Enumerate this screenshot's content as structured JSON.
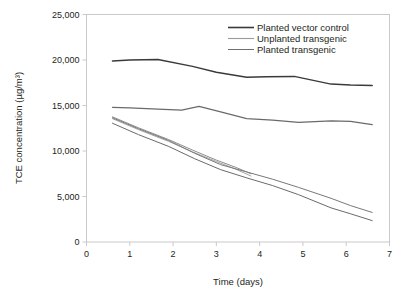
{
  "chart_data": {
    "type": "line",
    "title": "",
    "xlabel": "Time (days)",
    "ylabel": "TCE concentration (µg/m³)",
    "xlim": [
      0,
      7
    ],
    "ylim": [
      0,
      25000
    ],
    "xticks": [
      "0",
      "1",
      "2",
      "3",
      "4",
      "5",
      "6",
      "7"
    ],
    "xtick_values": [
      0,
      1,
      2,
      3,
      4,
      5,
      6,
      7
    ],
    "yticks": [
      "0",
      "5,000",
      "10,000",
      "15,000",
      "20,000",
      "25,000"
    ],
    "ytick_values": [
      0,
      5000,
      10000,
      15000,
      20000,
      25000
    ],
    "grid": false,
    "legend_position": "top-right",
    "legend": [
      {
        "name": "Planted vector control",
        "color": "#3a3a3a",
        "width": 1.6
      },
      {
        "name": "Unplanted transgenic",
        "color": "#9a9a9a",
        "width": 1.1
      },
      {
        "name": "Planted transgenic",
        "color": "#6f6f6f",
        "width": 1.0
      }
    ],
    "series": [
      {
        "name": "Planted vector control",
        "group": "Planted vector control",
        "color": "#3a3a3a",
        "width": 1.5,
        "x": [
          0.6,
          1.0,
          1.65,
          2.45,
          3.0,
          3.7,
          4.15,
          4.8,
          5.65,
          6.1,
          6.6
        ],
        "y": [
          19900,
          20000,
          20050,
          19300,
          18650,
          18100,
          18150,
          18200,
          17350,
          17250,
          17200
        ]
      },
      {
        "name": "Planted vector control 2",
        "group": "Planted vector control",
        "color": "#6a6a6a",
        "width": 1.2,
        "x": [
          0.6,
          1.0,
          1.65,
          2.2,
          2.6,
          3.1,
          3.7,
          4.3,
          4.9,
          5.65,
          6.1,
          6.6
        ],
        "y": [
          14800,
          14750,
          14600,
          14500,
          14900,
          14300,
          13550,
          13400,
          13150,
          13300,
          13250,
          12900
        ]
      },
      {
        "name": "Unplanted transgenic A",
        "group": "Unplanted transgenic",
        "color": "#8e8e8e",
        "width": 1.0,
        "x": [
          0.6,
          1.2,
          1.9,
          2.45,
          3.0,
          3.45,
          3.8
        ],
        "y": [
          13750,
          12550,
          11250,
          10100,
          9000,
          8200,
          7500
        ]
      },
      {
        "name": "Unplanted transgenic B",
        "group": "Unplanted transgenic",
        "color": "#a5a5a5",
        "width": 1.0,
        "x": [
          0.6,
          1.2,
          1.9,
          2.45,
          3.0,
          3.45,
          3.8
        ],
        "y": [
          13550,
          12350,
          11050,
          9900,
          8850,
          8000,
          7250
        ]
      },
      {
        "name": "Planted transgenic A",
        "group": "Planted transgenic",
        "color": "#787878",
        "width": 1.0,
        "x": [
          0.6,
          1.2,
          1.9,
          2.5,
          3.1,
          3.7,
          4.3,
          4.9,
          5.65,
          6.1,
          6.6
        ],
        "y": [
          13650,
          12450,
          11150,
          9750,
          8500,
          7700,
          6900,
          6000,
          4800,
          4000,
          3250
        ]
      },
      {
        "name": "Planted transgenic B",
        "group": "Planted transgenic",
        "color": "#6a6a6a",
        "width": 1.0,
        "x": [
          0.6,
          1.2,
          1.9,
          2.5,
          3.1,
          3.7,
          4.3,
          4.9,
          5.65,
          6.1,
          6.6
        ],
        "y": [
          13050,
          11800,
          10500,
          9150,
          7950,
          7050,
          6200,
          5200,
          3750,
          3100,
          2350
        ]
      }
    ]
  }
}
